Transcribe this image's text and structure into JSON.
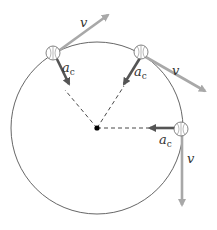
{
  "diagram": {
    "colors": {
      "circle": "#555555",
      "velocity": "#a8a8a8",
      "acceleration": "#555555",
      "radius_dash": "#333333",
      "center": "#000000"
    },
    "labels": {
      "velocity": "v",
      "acceleration_main": "a",
      "acceleration_sub": "c"
    },
    "positions": [
      {
        "name": "upper-left",
        "velocity_label": "v",
        "acceleration_label": "a",
        "acceleration_sub": "c"
      },
      {
        "name": "upper-right",
        "velocity_label": "v",
        "acceleration_label": "a",
        "acceleration_sub": "c"
      },
      {
        "name": "right",
        "velocity_label": "v",
        "acceleration_label": "a",
        "acceleration_sub": "c"
      }
    ]
  }
}
